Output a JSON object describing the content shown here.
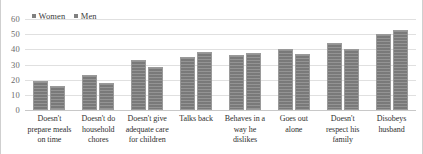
{
  "chart_data": {
    "type": "bar",
    "title": "",
    "subtitle": "",
    "xlabel": "",
    "ylabel": "",
    "ylim": [
      0,
      60
    ],
    "ytick_step": 10,
    "yticks": [
      "60",
      "50",
      "40",
      "30",
      "20",
      "10",
      "0"
    ],
    "grid": true,
    "legend_position": "top-left",
    "categories": [
      "Doesn't prepare meals on time",
      "Doesn't do household chores",
      "Doesn't give adequate care for children",
      "Talks back",
      "Behaves in a way he dislikes",
      "Goes out alone",
      "Doesn't respect his family",
      "Disobeys husband"
    ],
    "series": [
      {
        "name": "Women",
        "color": "#808080",
        "values": [
          19,
          23,
          33,
          35,
          36.5,
          40.5,
          44,
          50
        ]
      },
      {
        "name": "Men",
        "color": "#808080",
        "values": [
          16,
          18,
          28.5,
          38,
          37.5,
          37,
          40,
          52.5
        ]
      }
    ]
  },
  "legend": {
    "entries": [
      {
        "label": "Women",
        "marker": "square-marker"
      },
      {
        "label": "Men",
        "marker": "square-marker"
      }
    ]
  }
}
